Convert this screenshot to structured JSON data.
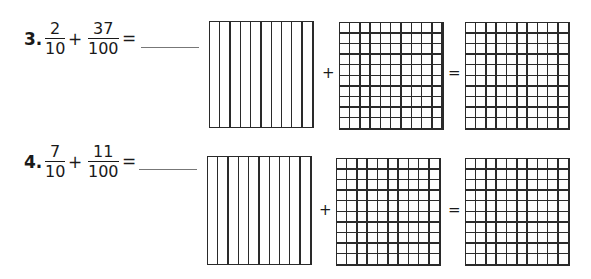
{
  "problems": [
    {
      "number": "3.",
      "fraction1": {
        "numerator": "2",
        "denominator": "10"
      },
      "operator": "+",
      "fraction2": {
        "numerator": "37",
        "denominator": "100"
      },
      "equals": "=",
      "answer": "",
      "models": {
        "first": "tenths-grid",
        "plus": "+",
        "second": "hundredths-grid",
        "equals": "=",
        "result": "hundredths-grid"
      }
    },
    {
      "number": "4.",
      "fraction1": {
        "numerator": "7",
        "denominator": "10"
      },
      "operator": "+",
      "fraction2": {
        "numerator": "11",
        "denominator": "100"
      },
      "equals": "=",
      "answer": "",
      "models": {
        "first": "tenths-grid",
        "plus": "+",
        "second": "hundredths-grid",
        "equals": "=",
        "result": "hundredths-grid"
      }
    }
  ]
}
